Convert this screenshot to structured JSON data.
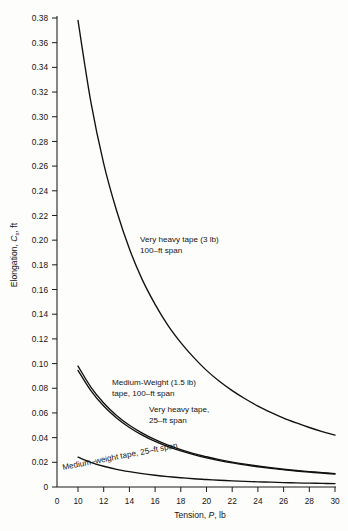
{
  "figure": {
    "background_color": "#fdfdfb",
    "ink_color": "#101010"
  },
  "chart_data": {
    "type": "line",
    "title": "",
    "subtitle": "",
    "xlabel": "Tension, P, lb",
    "xlabel_parts": {
      "pre": "Tension, ",
      "symbol": "P",
      "post": ", lb"
    },
    "ylabel": "Elongation, Cs, ft",
    "ylabel_parts": {
      "pre": "Elongation, ",
      "symbol": "C",
      "subscript": "s",
      "post": ", ft"
    },
    "xlim": [
      0,
      30
    ],
    "ylim": [
      0,
      0.38
    ],
    "grid": false,
    "legend_position": "inline-annotations",
    "xticks": [
      0,
      10,
      12,
      14,
      16,
      18,
      20,
      22,
      24,
      26,
      28,
      30
    ],
    "xtick_labels": [
      "0",
      "10",
      "12",
      "14",
      "16",
      "18",
      "20",
      "22",
      "24",
      "26",
      "28",
      "30"
    ],
    "yticks": [
      0,
      0.02,
      0.04,
      0.06,
      0.08,
      0.1,
      0.12,
      0.14,
      0.16,
      0.18,
      0.2,
      0.22,
      0.24,
      0.26,
      0.28,
      0.3,
      0.32,
      0.34,
      0.36,
      0.38
    ],
    "ytick_labels": [
      "0",
      "0.02",
      "0.04",
      "0.06",
      "0.08",
      "0.10",
      "0.12",
      "0.14",
      "0.16",
      "0.18",
      "0.20",
      "0.22",
      "0.24",
      "0.26",
      "0.28",
      "0.30",
      "0.32",
      "0.34",
      "0.36",
      "0.38"
    ],
    "x": [
      10,
      11,
      12,
      13,
      14,
      15,
      16,
      17,
      18,
      19,
      20,
      21,
      22,
      23,
      24,
      25,
      26,
      27,
      28,
      29,
      30
    ],
    "series": [
      {
        "name": "Very heavy tape (3 lb), 100-ft span",
        "values": [
          0.378,
          0.312,
          0.262,
          0.224,
          0.193,
          0.168,
          0.148,
          0.131,
          0.117,
          0.105,
          0.0945,
          0.0857,
          0.0781,
          0.0715,
          0.0656,
          0.0605,
          0.0559,
          0.0519,
          0.0482,
          0.0449,
          0.042
        ]
      },
      {
        "name": "Medium-Weight (1.5 lb) tape, 100-ft span",
        "values": [
          0.098,
          0.081,
          0.0681,
          0.058,
          0.05,
          0.0436,
          0.0383,
          0.0339,
          0.0303,
          0.0271,
          0.0245,
          0.0222,
          0.0202,
          0.0185,
          0.017,
          0.0157,
          0.0145,
          0.0134,
          0.0125,
          0.0117,
          0.0109
        ]
      },
      {
        "name": "Very heavy tape, 25-ft span",
        "values": [
          0.0945,
          0.0781,
          0.0656,
          0.0559,
          0.0482,
          0.042,
          0.0369,
          0.0327,
          0.0292,
          0.0262,
          0.0236,
          0.0214,
          0.0195,
          0.0179,
          0.0164,
          0.0151,
          0.014,
          0.013,
          0.012,
          0.0112,
          0.0105
        ]
      },
      {
        "name": "Medium-weight tape, 25-ft span",
        "values": [
          0.0242,
          0.02,
          0.0168,
          0.0143,
          0.0124,
          0.0108,
          0.0095,
          0.0084,
          0.0075,
          0.0067,
          0.0061,
          0.0055,
          0.005,
          0.0046,
          0.0042,
          0.0039,
          0.0036,
          0.0033,
          0.0031,
          0.0029,
          0.0027
        ]
      }
    ],
    "annotations": [
      {
        "id": "annot-very-heavy-100ft",
        "line1": "Very heavy tape (3 lb)",
        "line2": "100–ft span"
      },
      {
        "id": "annot-medium-weight-100ft",
        "line1": "Medium-Weight (1.5 lb)",
        "line2": "tape, 100–ft span"
      },
      {
        "id": "annot-very-heavy-25ft",
        "line1": "Very heavy tape,",
        "line2": "25–ft span"
      },
      {
        "id": "annot-medium-weight-25ft",
        "line1": "Medium–weight tape, 25–ft span",
        "line2": ""
      }
    ]
  }
}
